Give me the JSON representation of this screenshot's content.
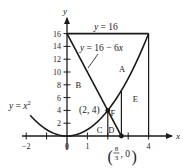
{
  "figure": {
    "axes": {
      "x_label": "x",
      "y_label": "y",
      "x_range": [
        -2.3,
        5
      ],
      "y_range": [
        -1,
        18
      ],
      "x_ticks": [
        -2,
        -1,
        0,
        1,
        2,
        3,
        4
      ],
      "x_tick_labels": [
        {
          "value": -2,
          "label": "−2"
        },
        {
          "value": 0,
          "label": "0"
        },
        {
          "value": 1,
          "label": "1"
        },
        {
          "value": 4,
          "label": "4"
        }
      ],
      "y_ticks": [
        2,
        4,
        6,
        8,
        10,
        12,
        14,
        16
      ],
      "y_tick_labels": [
        {
          "value": 2,
          "label": "2"
        },
        {
          "value": 4,
          "label": "4"
        },
        {
          "value": 6,
          "label": "6"
        },
        {
          "value": 8,
          "label": "8"
        },
        {
          "value": 10,
          "label": "10"
        },
        {
          "value": 12,
          "label": "12"
        },
        {
          "value": 14,
          "label": "14"
        },
        {
          "value": 16,
          "label": "16"
        }
      ]
    },
    "curves": [
      {
        "id": "parabola",
        "label": "y = x²",
        "label_text": "y = x",
        "label_sup": "2",
        "domain": [
          -1.8,
          4
        ]
      },
      {
        "id": "line",
        "label": "y = 16 − 6x",
        "domain": [
          0,
          2.6667
        ]
      },
      {
        "id": "horizontal",
        "label": "y = 16",
        "domain": [
          0,
          4
        ]
      }
    ],
    "vertical_lines": [
      {
        "x": 2,
        "from": 0,
        "to": 4
      },
      {
        "x": 2.6667,
        "from": 0,
        "to": 7.111
      },
      {
        "x": 4,
        "from": 0,
        "to": 16
      }
    ],
    "points": [
      {
        "id": "intersection",
        "x": 2,
        "y": 4,
        "label": "(2, 4)"
      },
      {
        "id": "x-intercept",
        "x": 2.6667,
        "y": 0,
        "label_num": "8",
        "label_den": "3",
        "label_tail": ", 0"
      }
    ],
    "regions": [
      {
        "label": "A",
        "x": 2.7,
        "y": 10.5
      },
      {
        "label": "B",
        "x": 0.55,
        "y": 7.9
      },
      {
        "label": "C",
        "x": 1.6,
        "y": 0.9
      },
      {
        "label": "D",
        "x": 2.17,
        "y": 0.9
      },
      {
        "label": "E",
        "x": 3.35,
        "y": 5.8
      },
      {
        "label": "F",
        "x": 2.25,
        "y": 3.6
      }
    ]
  }
}
